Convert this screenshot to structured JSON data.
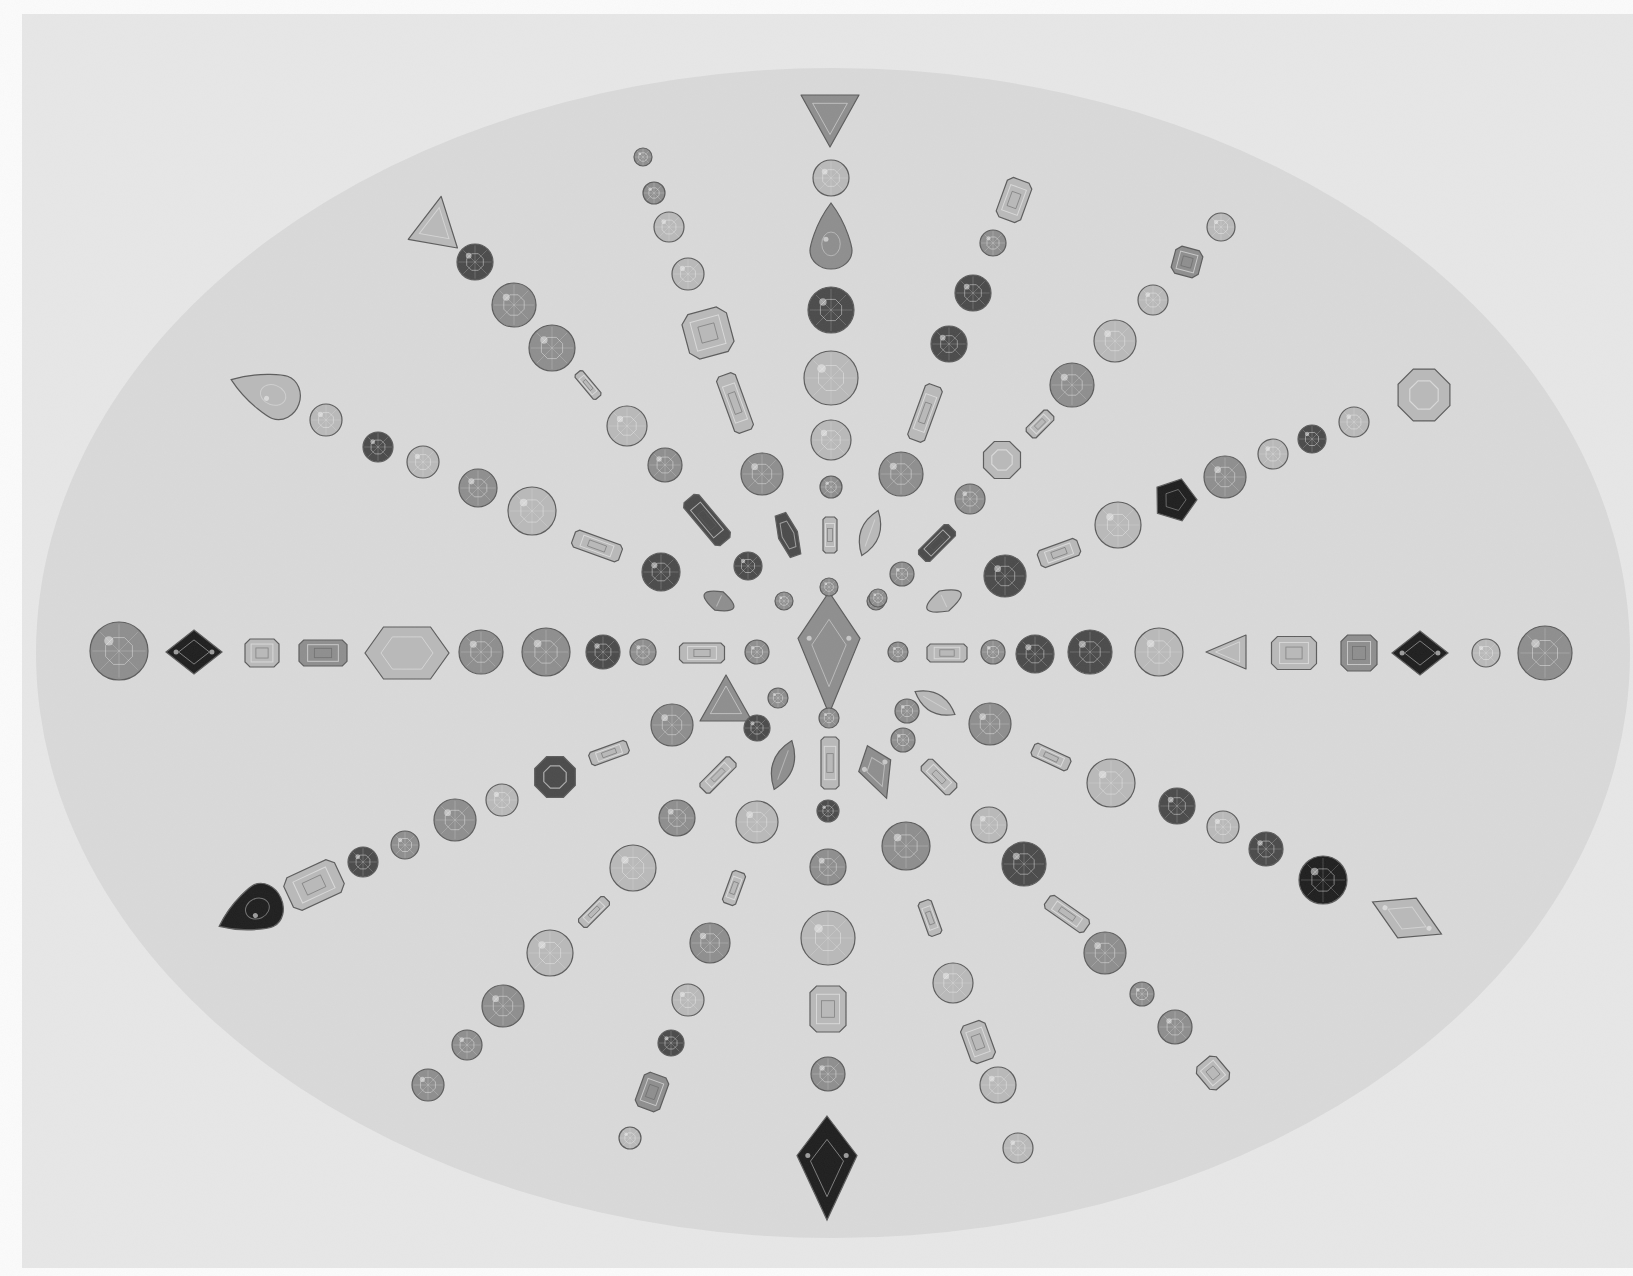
{
  "photo": {
    "caption": "",
    "description": "Gemstones of assorted cuts arranged in radiating arms on an oval backdrop",
    "colors": {
      "page": "#fbfbfb",
      "frame": "#e7e7e7",
      "oval": "#d9d9d9",
      "gem_light": "#b9b9b9",
      "gem_mid": "#8e8e8e",
      "gem_dark": "#4a4a4a",
      "gem_black": "#1e1e1e",
      "facet_hi": "#efefef",
      "outline": "#5c5c5c"
    },
    "frame": {
      "x": 22,
      "y": 14,
      "w": 1611,
      "h": 1254
    },
    "oval": {
      "cx": 833,
      "cy": 653,
      "rx": 797,
      "ry": 585
    }
  },
  "gems": [
    {
      "cut": "kite",
      "x": 829,
      "y": 653,
      "w": 62,
      "h": 122,
      "rot": 0,
      "tone": "mid"
    },
    {
      "cut": "round",
      "x": 119,
      "y": 651,
      "r": 29,
      "tone": "mid"
    },
    {
      "cut": "diamond",
      "x": 194,
      "y": 652,
      "w": 56,
      "h": 44,
      "rot": 0,
      "tone": "black"
    },
    {
      "cut": "emerald",
      "x": 262,
      "y": 653,
      "w": 34,
      "h": 28,
      "rot": 0,
      "tone": "light"
    },
    {
      "cut": "emerald",
      "x": 323,
      "y": 653,
      "w": 48,
      "h": 26,
      "rot": 0,
      "tone": "mid"
    },
    {
      "cut": "hexagon",
      "x": 407,
      "y": 653,
      "w": 84,
      "h": 52,
      "rot": 0,
      "tone": "light"
    },
    {
      "cut": "round",
      "x": 481,
      "y": 652,
      "r": 22,
      "tone": "mid"
    },
    {
      "cut": "round",
      "x": 546,
      "y": 652,
      "r": 24,
      "tone": "mid"
    },
    {
      "cut": "round",
      "x": 603,
      "y": 652,
      "r": 17,
      "tone": "dark"
    },
    {
      "cut": "round",
      "x": 643,
      "y": 652,
      "r": 13,
      "tone": "mid"
    },
    {
      "cut": "emerald",
      "x": 702,
      "y": 653,
      "w": 45,
      "h": 20,
      "rot": 0,
      "tone": "light"
    },
    {
      "cut": "round",
      "x": 757,
      "y": 652,
      "r": 12,
      "tone": "mid"
    },
    {
      "cut": "round",
      "x": 898,
      "y": 652,
      "r": 10,
      "tone": "mid"
    },
    {
      "cut": "emerald",
      "x": 947,
      "y": 653,
      "w": 40,
      "h": 18,
      "rot": 0,
      "tone": "light"
    },
    {
      "cut": "round",
      "x": 993,
      "y": 652,
      "r": 12,
      "tone": "mid"
    },
    {
      "cut": "round",
      "x": 1035,
      "y": 654,
      "r": 19,
      "tone": "dark"
    },
    {
      "cut": "round",
      "x": 1090,
      "y": 652,
      "r": 22,
      "tone": "dark"
    },
    {
      "cut": "round",
      "x": 1159,
      "y": 652,
      "r": 24,
      "tone": "light"
    },
    {
      "cut": "triangle",
      "x": 1226,
      "y": 652,
      "w": 34,
      "h": 40,
      "rot": -90,
      "tone": "light"
    },
    {
      "cut": "emerald",
      "x": 1294,
      "y": 653,
      "w": 45,
      "h": 33,
      "rot": 0,
      "tone": "light"
    },
    {
      "cut": "emerald",
      "x": 1359,
      "y": 653,
      "w": 36,
      "h": 36,
      "rot": 0,
      "tone": "mid"
    },
    {
      "cut": "diamond",
      "x": 1420,
      "y": 653,
      "w": 56,
      "h": 44,
      "rot": 0,
      "tone": "black"
    },
    {
      "cut": "round",
      "x": 1486,
      "y": 653,
      "r": 14,
      "tone": "light"
    },
    {
      "cut": "round",
      "x": 1545,
      "y": 653,
      "r": 27,
      "tone": "mid"
    },
    {
      "cut": "triangle",
      "x": 830,
      "y": 121,
      "w": 58,
      "h": 52,
      "rot": 180,
      "tone": "mid"
    },
    {
      "cut": "round",
      "x": 831,
      "y": 178,
      "r": 18,
      "tone": "light"
    },
    {
      "cut": "pear",
      "x": 831,
      "y": 236,
      "w": 42,
      "h": 66,
      "rot": 0,
      "tone": "mid"
    },
    {
      "cut": "round",
      "x": 831,
      "y": 310,
      "r": 23,
      "tone": "dark"
    },
    {
      "cut": "round",
      "x": 831,
      "y": 378,
      "r": 27,
      "tone": "light"
    },
    {
      "cut": "round",
      "x": 831,
      "y": 440,
      "r": 20,
      "tone": "light"
    },
    {
      "cut": "round",
      "x": 831,
      "y": 487,
      "r": 11,
      "tone": "mid"
    },
    {
      "cut": "emerald",
      "x": 830,
      "y": 535,
      "w": 14,
      "h": 36,
      "rot": 0,
      "tone": "light"
    },
    {
      "cut": "round",
      "x": 829,
      "y": 587,
      "r": 9,
      "tone": "mid"
    },
    {
      "cut": "round",
      "x": 829,
      "y": 718,
      "r": 10,
      "tone": "mid"
    },
    {
      "cut": "emerald",
      "x": 830,
      "y": 763,
      "w": 18,
      "h": 52,
      "rot": 0,
      "tone": "light"
    },
    {
      "cut": "round",
      "x": 828,
      "y": 811,
      "r": 11,
      "tone": "dark"
    },
    {
      "cut": "round",
      "x": 828,
      "y": 867,
      "r": 18,
      "tone": "mid"
    },
    {
      "cut": "round",
      "x": 828,
      "y": 938,
      "r": 27,
      "tone": "light"
    },
    {
      "cut": "emerald",
      "x": 828,
      "y": 1009,
      "w": 36,
      "h": 46,
      "rot": 0,
      "tone": "light"
    },
    {
      "cut": "round",
      "x": 828,
      "y": 1074,
      "r": 17,
      "tone": "mid"
    },
    {
      "cut": "kite",
      "x": 827,
      "y": 1168,
      "w": 60,
      "h": 104,
      "rot": 0,
      "tone": "black"
    },
    {
      "cut": "round",
      "x": 643,
      "y": 157,
      "r": 9,
      "tone": "mid"
    },
    {
      "cut": "round",
      "x": 654,
      "y": 193,
      "r": 11,
      "tone": "mid"
    },
    {
      "cut": "round",
      "x": 669,
      "y": 227,
      "r": 15,
      "tone": "light"
    },
    {
      "cut": "round",
      "x": 688,
      "y": 274,
      "r": 16,
      "tone": "light"
    },
    {
      "cut": "emerald",
      "x": 708,
      "y": 333,
      "w": 46,
      "h": 46,
      "rot": -15,
      "tone": "light"
    },
    {
      "cut": "emerald",
      "x": 735,
      "y": 403,
      "w": 20,
      "h": 60,
      "rot": -20,
      "tone": "light"
    },
    {
      "cut": "round",
      "x": 762,
      "y": 474,
      "r": 21,
      "tone": "mid"
    },
    {
      "cut": "hexagon",
      "x": 788,
      "y": 535,
      "w": 20,
      "h": 44,
      "rot": -20,
      "tone": "dark"
    },
    {
      "cut": "round",
      "x": 784,
      "y": 601,
      "r": 9,
      "tone": "mid"
    },
    {
      "cut": "triangle",
      "x": 437,
      "y": 220,
      "w": 50,
      "h": 48,
      "rot": 10,
      "tone": "light"
    },
    {
      "cut": "round",
      "x": 475,
      "y": 262,
      "r": 18,
      "tone": "dark"
    },
    {
      "cut": "round",
      "x": 514,
      "y": 305,
      "r": 22,
      "tone": "mid"
    },
    {
      "cut": "round",
      "x": 552,
      "y": 348,
      "r": 23,
      "tone": "mid"
    },
    {
      "cut": "emerald",
      "x": 588,
      "y": 385,
      "w": 10,
      "h": 32,
      "rot": -40,
      "tone": "light"
    },
    {
      "cut": "round",
      "x": 627,
      "y": 426,
      "r": 20,
      "tone": "light"
    },
    {
      "cut": "round",
      "x": 665,
      "y": 465,
      "r": 17,
      "tone": "mid"
    },
    {
      "cut": "emerald",
      "x": 707,
      "y": 520,
      "w": 20,
      "h": 56,
      "rot": -40,
      "tone": "dark"
    },
    {
      "cut": "round",
      "x": 748,
      "y": 566,
      "r": 14,
      "tone": "dark"
    },
    {
      "cut": "marquise",
      "x": 719,
      "y": 601,
      "w": 38,
      "h": 20,
      "rot": 25,
      "tone": "mid"
    },
    {
      "cut": "pear",
      "x": 265,
      "y": 392,
      "w": 45,
      "h": 72,
      "rot": -70,
      "tone": "light"
    },
    {
      "cut": "round",
      "x": 326,
      "y": 420,
      "r": 16,
      "tone": "light"
    },
    {
      "cut": "round",
      "x": 378,
      "y": 447,
      "r": 15,
      "tone": "dark"
    },
    {
      "cut": "round",
      "x": 423,
      "y": 462,
      "r": 16,
      "tone": "light"
    },
    {
      "cut": "round",
      "x": 478,
      "y": 488,
      "r": 19,
      "tone": "mid"
    },
    {
      "cut": "round",
      "x": 532,
      "y": 511,
      "r": 24,
      "tone": "light"
    },
    {
      "cut": "emerald",
      "x": 597,
      "y": 546,
      "w": 50,
      "h": 18,
      "rot": 20,
      "tone": "light"
    },
    {
      "cut": "round",
      "x": 661,
      "y": 572,
      "r": 19,
      "tone": "dark"
    },
    {
      "cut": "emerald",
      "x": 1014,
      "y": 200,
      "w": 26,
      "h": 42,
      "rot": 20,
      "tone": "light"
    },
    {
      "cut": "round",
      "x": 993,
      "y": 243,
      "r": 13,
      "tone": "mid"
    },
    {
      "cut": "round",
      "x": 973,
      "y": 293,
      "r": 18,
      "tone": "dark"
    },
    {
      "cut": "round",
      "x": 949,
      "y": 344,
      "r": 18,
      "tone": "dark"
    },
    {
      "cut": "emerald",
      "x": 925,
      "y": 413,
      "w": 18,
      "h": 58,
      "rot": 20,
      "tone": "light"
    },
    {
      "cut": "round",
      "x": 901,
      "y": 474,
      "r": 22,
      "tone": "mid"
    },
    {
      "cut": "marquise",
      "x": 870,
      "y": 533,
      "w": 22,
      "h": 48,
      "rot": 20,
      "tone": "light"
    },
    {
      "cut": "round",
      "x": 876,
      "y": 601,
      "r": 9,
      "tone": "mid"
    },
    {
      "cut": "round",
      "x": 1221,
      "y": 227,
      "r": 14,
      "tone": "light"
    },
    {
      "cut": "emerald",
      "x": 1187,
      "y": 262,
      "w": 28,
      "h": 28,
      "rot": 15,
      "tone": "mid"
    },
    {
      "cut": "round",
      "x": 1153,
      "y": 300,
      "r": 15,
      "tone": "light"
    },
    {
      "cut": "round",
      "x": 1115,
      "y": 341,
      "r": 21,
      "tone": "light"
    },
    {
      "cut": "round",
      "x": 1072,
      "y": 385,
      "r": 22,
      "tone": "mid"
    },
    {
      "cut": "emerald",
      "x": 1040,
      "y": 424,
      "w": 14,
      "h": 30,
      "rot": 45,
      "tone": "light"
    },
    {
      "cut": "octagon",
      "x": 1002,
      "y": 460,
      "r": 20,
      "tone": "light"
    },
    {
      "cut": "round",
      "x": 970,
      "y": 499,
      "r": 15,
      "tone": "mid"
    },
    {
      "cut": "emerald",
      "x": 937,
      "y": 543,
      "w": 16,
      "h": 42,
      "rot": 45,
      "tone": "dark"
    },
    {
      "cut": "round",
      "x": 902,
      "y": 574,
      "r": 12,
      "tone": "mid"
    },
    {
      "cut": "marquise",
      "x": 944,
      "y": 601,
      "w": 44,
      "h": 22,
      "rot": -25,
      "tone": "light"
    },
    {
      "cut": "round",
      "x": 878,
      "y": 598,
      "r": 9,
      "tone": "mid"
    },
    {
      "cut": "octagon",
      "x": 1424,
      "y": 395,
      "r": 28,
      "tone": "light"
    },
    {
      "cut": "round",
      "x": 1354,
      "y": 422,
      "r": 15,
      "tone": "light"
    },
    {
      "cut": "round",
      "x": 1312,
      "y": 439,
      "r": 14,
      "tone": "dark"
    },
    {
      "cut": "round",
      "x": 1273,
      "y": 454,
      "r": 15,
      "tone": "light"
    },
    {
      "cut": "round",
      "x": 1225,
      "y": 477,
      "r": 21,
      "tone": "mid"
    },
    {
      "cut": "pentagon",
      "x": 1175,
      "y": 500,
      "r": 22,
      "tone": "black"
    },
    {
      "cut": "round",
      "x": 1118,
      "y": 525,
      "r": 23,
      "tone": "light"
    },
    {
      "cut": "emerald",
      "x": 1059,
      "y": 553,
      "w": 42,
      "h": 18,
      "rot": -20,
      "tone": "light"
    },
    {
      "cut": "round",
      "x": 1005,
      "y": 576,
      "r": 21,
      "tone": "dark"
    },
    {
      "cut": "triangle",
      "x": 726,
      "y": 698,
      "w": 52,
      "h": 46,
      "rot": 0,
      "tone": "mid"
    },
    {
      "cut": "round",
      "x": 672,
      "y": 725,
      "r": 21,
      "tone": "mid"
    },
    {
      "cut": "emerald",
      "x": 609,
      "y": 753,
      "w": 40,
      "h": 14,
      "rot": -20,
      "tone": "light"
    },
    {
      "cut": "octagon",
      "x": 555,
      "y": 777,
      "r": 22,
      "tone": "dark"
    },
    {
      "cut": "round",
      "x": 502,
      "y": 800,
      "r": 16,
      "tone": "light"
    },
    {
      "cut": "round",
      "x": 455,
      "y": 820,
      "r": 21,
      "tone": "mid"
    },
    {
      "cut": "round",
      "x": 405,
      "y": 845,
      "r": 14,
      "tone": "mid"
    },
    {
      "cut": "round",
      "x": 363,
      "y": 862,
      "r": 15,
      "tone": "dark"
    },
    {
      "cut": "emerald",
      "x": 314,
      "y": 885,
      "w": 56,
      "h": 36,
      "rot": -25,
      "tone": "light"
    },
    {
      "cut": "pear",
      "x": 250,
      "y": 912,
      "w": 46,
      "h": 68,
      "rot": -115,
      "tone": "black"
    },
    {
      "cut": "round",
      "x": 778,
      "y": 698,
      "r": 10,
      "tone": "mid"
    },
    {
      "cut": "round",
      "x": 757,
      "y": 728,
      "r": 13,
      "tone": "dark"
    },
    {
      "cut": "emerald",
      "x": 718,
      "y": 775,
      "w": 14,
      "h": 42,
      "rot": 45,
      "tone": "light"
    },
    {
      "cut": "round",
      "x": 677,
      "y": 818,
      "r": 18,
      "tone": "mid"
    },
    {
      "cut": "round",
      "x": 633,
      "y": 868,
      "r": 23,
      "tone": "light"
    },
    {
      "cut": "emerald",
      "x": 594,
      "y": 912,
      "w": 12,
      "h": 36,
      "rot": 45,
      "tone": "light"
    },
    {
      "cut": "round",
      "x": 550,
      "y": 953,
      "r": 23,
      "tone": "light"
    },
    {
      "cut": "round",
      "x": 503,
      "y": 1006,
      "r": 21,
      "tone": "mid"
    },
    {
      "cut": "round",
      "x": 467,
      "y": 1045,
      "r": 15,
      "tone": "mid"
    },
    {
      "cut": "round",
      "x": 428,
      "y": 1085,
      "r": 16,
      "tone": "mid"
    },
    {
      "cut": "marquise",
      "x": 783,
      "y": 765,
      "w": 24,
      "h": 52,
      "rot": 20,
      "tone": "mid"
    },
    {
      "cut": "round",
      "x": 757,
      "y": 822,
      "r": 21,
      "tone": "light"
    },
    {
      "cut": "emerald",
      "x": 734,
      "y": 888,
      "w": 14,
      "h": 34,
      "rot": 20,
      "tone": "light"
    },
    {
      "cut": "round",
      "x": 710,
      "y": 943,
      "r": 20,
      "tone": "mid"
    },
    {
      "cut": "round",
      "x": 688,
      "y": 1000,
      "r": 16,
      "tone": "light"
    },
    {
      "cut": "round",
      "x": 671,
      "y": 1043,
      "r": 13,
      "tone": "dark"
    },
    {
      "cut": "emerald",
      "x": 652,
      "y": 1092,
      "w": 26,
      "h": 36,
      "rot": 20,
      "tone": "mid"
    },
    {
      "cut": "round",
      "x": 630,
      "y": 1138,
      "r": 11,
      "tone": "light"
    },
    {
      "cut": "kite",
      "x": 877,
      "y": 772,
      "w": 34,
      "h": 56,
      "rot": -20,
      "tone": "mid"
    },
    {
      "cut": "round",
      "x": 906,
      "y": 846,
      "r": 24,
      "tone": "mid"
    },
    {
      "cut": "emerald",
      "x": 930,
      "y": 918,
      "w": 14,
      "h": 36,
      "rot": -20,
      "tone": "light"
    },
    {
      "cut": "round",
      "x": 953,
      "y": 983,
      "r": 20,
      "tone": "light"
    },
    {
      "cut": "emerald",
      "x": 978,
      "y": 1042,
      "w": 26,
      "h": 40,
      "rot": -20,
      "tone": "light"
    },
    {
      "cut": "round",
      "x": 998,
      "y": 1085,
      "r": 18,
      "tone": "light"
    },
    {
      "cut": "round",
      "x": 1018,
      "y": 1148,
      "r": 15,
      "tone": "light"
    },
    {
      "cut": "round",
      "x": 907,
      "y": 711,
      "r": 12,
      "tone": "mid"
    },
    {
      "cut": "marquise",
      "x": 935,
      "y": 703,
      "w": 22,
      "h": 46,
      "rot": -60,
      "tone": "light"
    },
    {
      "cut": "emerald",
      "x": 939,
      "y": 777,
      "w": 16,
      "h": 40,
      "rot": -45,
      "tone": "light"
    },
    {
      "cut": "round",
      "x": 989,
      "y": 825,
      "r": 18,
      "tone": "light"
    },
    {
      "cut": "round",
      "x": 1024,
      "y": 864,
      "r": 22,
      "tone": "dark"
    },
    {
      "cut": "emerald",
      "x": 1067,
      "y": 914,
      "w": 16,
      "h": 48,
      "rot": -55,
      "tone": "light"
    },
    {
      "cut": "round",
      "x": 1105,
      "y": 953,
      "r": 21,
      "tone": "mid"
    },
    {
      "cut": "round",
      "x": 1142,
      "y": 994,
      "r": 12,
      "tone": "mid"
    },
    {
      "cut": "round",
      "x": 1175,
      "y": 1027,
      "r": 17,
      "tone": "mid"
    },
    {
      "cut": "emerald",
      "x": 1213,
      "y": 1073,
      "w": 26,
      "h": 30,
      "rot": -40,
      "tone": "light"
    },
    {
      "cut": "round",
      "x": 903,
      "y": 740,
      "r": 12,
      "tone": "mid"
    },
    {
      "cut": "round",
      "x": 990,
      "y": 724,
      "r": 21,
      "tone": "mid"
    },
    {
      "cut": "emerald",
      "x": 1051,
      "y": 757,
      "w": 40,
      "h": 14,
      "rot": 25,
      "tone": "light"
    },
    {
      "cut": "round",
      "x": 1111,
      "y": 783,
      "r": 24,
      "tone": "light"
    },
    {
      "cut": "round",
      "x": 1177,
      "y": 806,
      "r": 18,
      "tone": "dark"
    },
    {
      "cut": "round",
      "x": 1223,
      "y": 827,
      "r": 16,
      "tone": "light"
    },
    {
      "cut": "round",
      "x": 1266,
      "y": 849,
      "r": 17,
      "tone": "dark"
    },
    {
      "cut": "round",
      "x": 1323,
      "y": 880,
      "r": 24,
      "tone": "black"
    },
    {
      "cut": "diamond",
      "x": 1407,
      "y": 918,
      "w": 76,
      "h": 44,
      "rot": 25,
      "tone": "light"
    }
  ]
}
